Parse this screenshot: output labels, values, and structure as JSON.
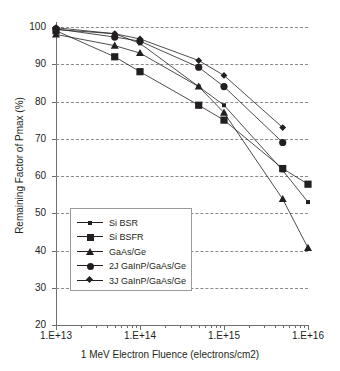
{
  "chart_data": {
    "type": "line",
    "title": "",
    "xlabel": "1 MeV Electron Fluence (electrons/cm2)",
    "ylabel": "Remaining Factor of Pmax (%)",
    "xscale": "log",
    "xlim": [
      10000000000000.0,
      1e+16
    ],
    "ylim": [
      20,
      100
    ],
    "ytick_labels": [
      "100",
      "90",
      "80",
      "70",
      "60",
      "50",
      "40",
      "30",
      "20"
    ],
    "ytick_values": [
      100,
      90,
      80,
      70,
      60,
      50,
      40,
      30,
      20
    ],
    "xtick_labels": [
      "1.E+13",
      "1.E+14",
      "1.E+15",
      "1.E+16"
    ],
    "xtick_values": [
      10000000000000.0,
      100000000000000.0,
      1000000000000000.0,
      1e+16
    ],
    "grid": "horizontal-dashed",
    "legend_position": "inside-lower-left",
    "x": [
      10000000000000.0,
      50000000000000.0,
      100000000000000.0,
      500000000000000.0,
      1000000000000000.0,
      5000000000000000.0,
      1e+16
    ],
    "series": [
      {
        "name": "Si BSR",
        "marker": "small-square",
        "values": [
          99.3,
          98.2,
          95.6,
          84.0,
          79.0,
          61.5,
          53.0
        ]
      },
      {
        "name": "Si BSFR",
        "marker": "large-square",
        "values": [
          99.0,
          92.0,
          88.0,
          79.0,
          75.0,
          62.0,
          57.8
        ]
      },
      {
        "name": "GaAs/Ge",
        "marker": "triangle",
        "values": [
          98.0,
          95.0,
          93.0,
          84.0,
          77.0,
          53.8,
          40.7
        ]
      },
      {
        "name": "2J GaInP/GaAs/Ge",
        "marker": "circle",
        "values": [
          99.5,
          97.3,
          96.2,
          89.2,
          84.0,
          69.0,
          null
        ]
      },
      {
        "name": "3J GaInP/GaAs/Ge",
        "marker": "diamond",
        "values": [
          99.8,
          98.2,
          96.8,
          91.0,
          87.0,
          73.0,
          null
        ]
      }
    ]
  },
  "axis": {
    "x_title": "1 MeV Electron Fluence (electrons/cm2)",
    "y_title": "Remaining Factor of Pmax (%)"
  },
  "legend": {
    "items": [
      {
        "label": "Si BSR",
        "marker": "small-square"
      },
      {
        "label": "Si BSFR",
        "marker": "large-square"
      },
      {
        "label": "GaAs/Ge",
        "marker": "triangle"
      },
      {
        "label": "2J GaInP/GaAs/Ge",
        "marker": "circle"
      },
      {
        "label": "3J GaInP/GaAs/Ge",
        "marker": "diamond"
      }
    ]
  },
  "colors": {
    "ink": "#231f20",
    "grid": "#8a8a8a",
    "axis": "#6d6e70",
    "legend_border": "#9a9a9a",
    "background": "#ffffff"
  }
}
